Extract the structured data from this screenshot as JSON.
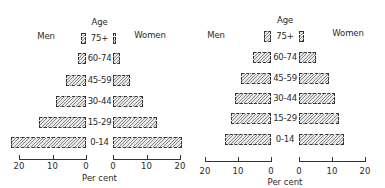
{
  "chart_data": [
    {
      "type": "bar",
      "subtype": "population-pyramid",
      "title": "",
      "center_label": "Age",
      "left_label": "Men",
      "right_label": "Women",
      "xlabel": "Per cent",
      "categories": [
        "75+",
        "60-74",
        "45-59",
        "30-44",
        "15-29",
        "0-14"
      ],
      "series": [
        {
          "name": "Men",
          "values": [
            1.5,
            2.5,
            6,
            9,
            14,
            22.5
          ]
        },
        {
          "name": "Women",
          "values": [
            1,
            2,
            5,
            9,
            13,
            20.5
          ]
        }
      ],
      "xticks_left": [
        "20",
        "10",
        "0"
      ],
      "xticks_right": [
        "0",
        "10",
        "20"
      ],
      "xlim": [
        0,
        20
      ]
    },
    {
      "type": "bar",
      "subtype": "population-pyramid",
      "title": "",
      "center_label": "Age",
      "left_label": "Men",
      "right_label": "Women",
      "xlabel": "Per cent",
      "categories": [
        "75+",
        "60-74",
        "45-59",
        "30-44",
        "15-29",
        "0-14"
      ],
      "series": [
        {
          "name": "Men",
          "values": [
            2,
            5.5,
            9,
            11,
            12,
            14
          ]
        },
        {
          "name": "Women",
          "values": [
            1.5,
            5,
            9,
            11,
            12,
            13.5
          ]
        }
      ],
      "xticks_left": [
        "20",
        "10",
        "0"
      ],
      "xticks_right": [
        "0",
        "10",
        "20"
      ],
      "xlim": [
        0,
        20
      ]
    }
  ]
}
